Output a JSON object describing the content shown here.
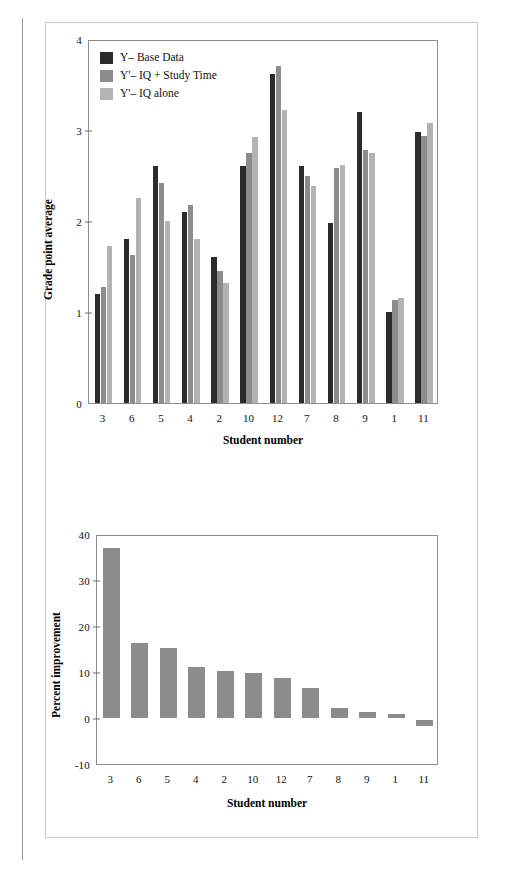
{
  "colors": {
    "series_base": "#2b2b2b",
    "series_iq_study": "#8c8c8c",
    "series_iq_alone": "#b3b3b3",
    "single_bar": "#8c8c8c",
    "frame": "#8e8e8e",
    "panel_border": "#c9c9c9",
    "text": "#111111"
  },
  "legend": {
    "items": [
      {
        "label": "Y– Base Data",
        "swatch": "#2b2b2b"
      },
      {
        "label": "Y'– IQ + Study Time",
        "swatch": "#8c8c8c"
      },
      {
        "label": "Y'– IQ alone",
        "swatch": "#b3b3b3"
      }
    ]
  },
  "chart_data": [
    {
      "id": "gpa-chart",
      "type": "bar",
      "title": "",
      "xlabel": "Student number",
      "ylabel": "Grade point average",
      "categories": [
        "3",
        "6",
        "5",
        "4",
        "2",
        "10",
        "12",
        "7",
        "8",
        "9",
        "1",
        "11"
      ],
      "ylim": [
        0,
        4
      ],
      "yticks": [
        0,
        1,
        2,
        3,
        4
      ],
      "ytick_labels": [
        "0",
        "1",
        "2",
        "3",
        "4"
      ],
      "grid": false,
      "legend_position": "top-left",
      "series": [
        {
          "name": "Y– Base Data",
          "color": "#2b2b2b",
          "values": [
            1.2,
            1.8,
            2.6,
            2.1,
            1.6,
            2.6,
            3.62,
            2.6,
            1.98,
            3.2,
            1.0,
            2.98
          ]
        },
        {
          "name": "Y'– IQ + Study Time",
          "color": "#8c8c8c",
          "values": [
            1.28,
            1.63,
            2.42,
            2.18,
            1.45,
            2.75,
            3.7,
            2.5,
            2.58,
            2.78,
            1.13,
            2.93
          ]
        },
        {
          "name": "Y'– IQ alone",
          "color": "#b3b3b3",
          "values": [
            1.72,
            2.25,
            2.0,
            1.8,
            1.32,
            2.92,
            3.22,
            2.38,
            2.62,
            2.75,
            1.15,
            3.08
          ]
        }
      ]
    },
    {
      "id": "improvement-chart",
      "type": "bar",
      "title": "",
      "xlabel": "Student number",
      "ylabel": "Percent improvement",
      "categories": [
        "3",
        "6",
        "5",
        "4",
        "2",
        "10",
        "12",
        "7",
        "8",
        "9",
        "1",
        "11"
      ],
      "ylim": [
        -10,
        40
      ],
      "yticks": [
        -10,
        0,
        10,
        20,
        30,
        40
      ],
      "ytick_labels": [
        "-10",
        "0",
        "10",
        "20",
        "30",
        "40"
      ],
      "grid": false,
      "legend_position": "none",
      "series": [
        {
          "name": "Percent improvement",
          "color": "#8c8c8c",
          "values": [
            37.0,
            16.2,
            15.3,
            11.0,
            10.3,
            9.8,
            8.7,
            6.5,
            2.1,
            1.3,
            0.8,
            -1.3
          ]
        }
      ]
    }
  ]
}
